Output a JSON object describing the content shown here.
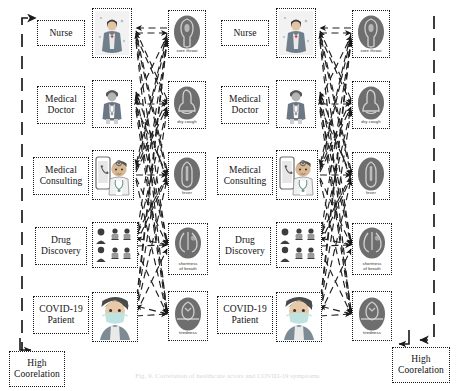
{
  "figure": {
    "caption": "Fig. 9.  Correlation of healthcare actors and COVID-19 symptoms.",
    "arrow_up_icon": "arrow-up-right-icon",
    "arrow_down_icon": "arrow-down-left-icon"
  },
  "corners": {
    "bottom_left": {
      "line1": "High",
      "line2": "Coorelation"
    },
    "bottom_right": {
      "line1": "High",
      "line2": "Coorelation"
    }
  },
  "left_panel": {
    "actors": [
      {
        "line1": "Nurse",
        "line2": "",
        "icon": "nurse-icon"
      },
      {
        "line1": "Medical",
        "line2": "Doctor",
        "icon": "doctor-icon"
      },
      {
        "line1": "Medical",
        "line2": "Consulting",
        "icon": "telemedicine-icon"
      },
      {
        "line1": "Drug",
        "line2": "Discovery",
        "icon": "drug-discovery-icon"
      },
      {
        "line1": "COVID-19",
        "line2": "Patient",
        "icon": "covid-patient-icon"
      }
    ],
    "symptoms": [
      {
        "line1": "sore throat",
        "line2": "",
        "icon": "sore-throat-icon"
      },
      {
        "line1": "dry cough",
        "line2": "",
        "icon": "dry-cough-icon"
      },
      {
        "line1": "fever",
        "line2": "",
        "icon": "fever-icon"
      },
      {
        "line1": "shortness",
        "line2": "of breath",
        "icon": "shortness-of-breath-icon"
      },
      {
        "line1": "tiredness",
        "line2": "",
        "icon": "tiredness-icon"
      }
    ]
  },
  "right_panel": {
    "actors": [
      {
        "line1": "Nurse",
        "line2": "",
        "icon": "nurse-icon"
      },
      {
        "line1": "Medical",
        "line2": "Doctor",
        "icon": "doctor-icon"
      },
      {
        "line1": "Medical",
        "line2": "Consulting",
        "icon": "telemedicine-icon"
      },
      {
        "line1": "Drug",
        "line2": "Discovery",
        "icon": "drug-discovery-icon"
      },
      {
        "line1": "COVID-19",
        "line2": "Patient",
        "icon": "covid-patient-icon"
      }
    ],
    "symptoms": [
      {
        "line1": "sore throat",
        "line2": "",
        "icon": "sore-throat-icon"
      },
      {
        "line1": "dry cough",
        "line2": "",
        "icon": "dry-cough-icon"
      },
      {
        "line1": "fever",
        "line2": "",
        "icon": "fever-icon"
      },
      {
        "line1": "shortness",
        "line2": "of breath",
        "icon": "shortness-of-breath-icon"
      },
      {
        "line1": "tiredness",
        "line2": "",
        "icon": "tiredness-icon"
      }
    ]
  },
  "colors": {
    "line": "#1a1a1a",
    "edge": "#222222",
    "icon_gray": "#8c8c8c",
    "icon_dark": "#5d5d5d",
    "skin": "#e8c9a8",
    "mask": "#bfe3e0",
    "hair": "#4a4a4a"
  }
}
